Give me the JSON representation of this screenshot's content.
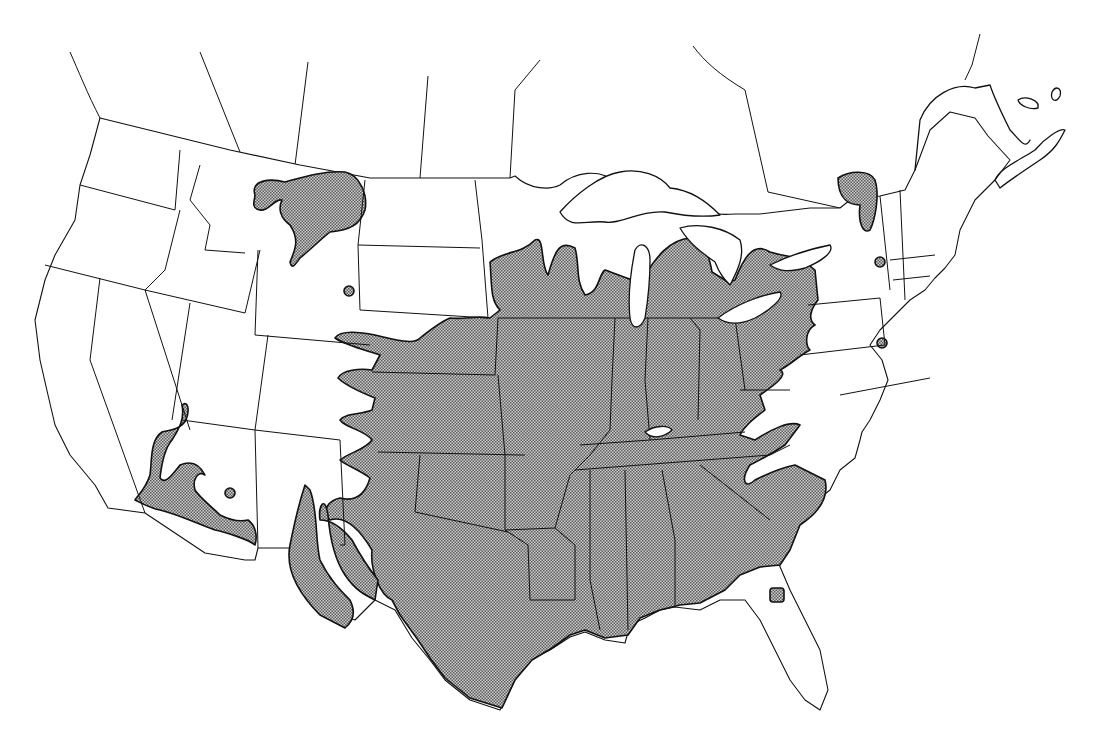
{
  "map": {
    "type": "species range map",
    "region": "contiguous United States with southern Canada outline",
    "style": "black-and-white line drawing",
    "colors": {
      "background": "#ffffff",
      "lines": "#111111",
      "range_fill_dark": "#5a5a5a",
      "range_fill_light": "#cfcfcf"
    },
    "legend": null,
    "text_labels": [],
    "shaded_range": {
      "description": "stippled distribution covering the eastern and central US",
      "core_states": [
        "Texas",
        "Oklahoma",
        "Kansas",
        "Nebraska (east)",
        "Iowa",
        "Missouri",
        "Arkansas",
        "Louisiana",
        "Mississippi",
        "Alabama",
        "Georgia",
        "South Carolina",
        "Tennessee",
        "Kentucky",
        "Illinois",
        "Indiana",
        "Ohio",
        "Wisconsin (south)",
        "Minnesota (south)",
        "Michigan (south)",
        "Pennsylvania (west)",
        "New York (west)",
        "West Virginia (west)"
      ],
      "outliers": [
        "central Montana",
        "northeast Wyoming spot",
        "Arizona / southern California river corridors",
        "New Mexico river fingers",
        "Lake Champlain area",
        "southeast New York spot",
        "Delaware / Maryland spot",
        "northern Florida spot"
      ]
    }
  }
}
